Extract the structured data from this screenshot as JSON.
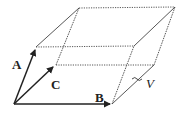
{
  "diagram": {
    "labels": {
      "A": "A",
      "B": "B",
      "C": "C",
      "V": "V"
    },
    "colors": {
      "stroke": "#222222",
      "background": "#ffffff"
    }
  }
}
